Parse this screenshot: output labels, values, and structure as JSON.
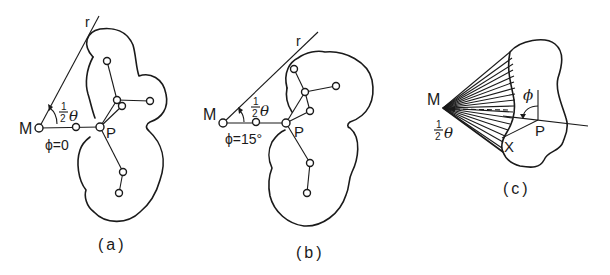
{
  "figure": {
    "panels": [
      {
        "id": "a",
        "caption": "(a)",
        "labels": {
          "ray": "r",
          "origin": "M",
          "point": "P",
          "half": "1",
          "half_den": "2",
          "theta": "θ",
          "phi_eq": "ϕ=0"
        }
      },
      {
        "id": "b",
        "caption": "(b)",
        "labels": {
          "ray": "r",
          "origin": "M",
          "point": "P",
          "half": "1",
          "half_den": "2",
          "theta": "θ",
          "phi_eq": "ϕ=15°"
        }
      },
      {
        "id": "c",
        "caption": "(c)",
        "labels": {
          "origin": "M",
          "point": "P",
          "cross": "X",
          "phi": "ϕ",
          "half": "1",
          "half_den": "2",
          "theta": "θ"
        }
      }
    ],
    "colors": {
      "ink": "#1a1a1a",
      "background": "#ffffff"
    }
  }
}
